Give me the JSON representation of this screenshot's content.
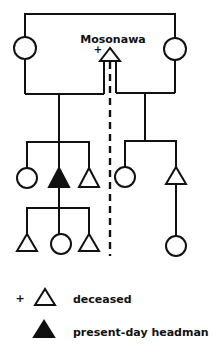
{
  "diagram": {
    "title_person": "Mosonawa",
    "deceased_marker": "+",
    "colors": {
      "line": "#111111",
      "background": "#ffffff"
    }
  },
  "legend": {
    "items": [
      {
        "marker": "+",
        "symbol": "open-triangle",
        "label": "deceased"
      },
      {
        "marker": "",
        "symbol": "filled-triangle",
        "label": "present-day headman"
      }
    ]
  },
  "symbols_key": {
    "triangle": "male",
    "circle": "female",
    "dashed_line": "lineage-division"
  }
}
